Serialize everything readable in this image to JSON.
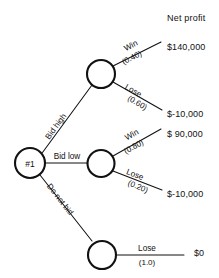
{
  "diagram": {
    "column_header": "Net profit",
    "colors": {
      "ink": "#111111",
      "background": "#ffffff"
    },
    "decision_node": {
      "label": "#1",
      "kind": "decision-node"
    },
    "chance_nodes": [
      {
        "id": "bid-high-chance-node",
        "label": ""
      },
      {
        "id": "bid-low-chance-node",
        "label": ""
      },
      {
        "id": "do-not-bid-chance-node",
        "label": ""
      }
    ],
    "decision_branches": [
      {
        "label": "Bid high",
        "direction": "up"
      },
      {
        "label": "Bid low",
        "direction": "straight"
      },
      {
        "label": "Do not bid",
        "direction": "down"
      }
    ],
    "outcome_branches": [
      {
        "label": "Win",
        "probability": "(0.40)",
        "payoff": "$140,000",
        "parent": "Bid high"
      },
      {
        "label": "Lose",
        "probability": "(0.60)",
        "payoff": "$-10,000",
        "parent": "Bid high"
      },
      {
        "label": "Win",
        "probability": "(0.80)",
        "payoff": "$ 90,000",
        "parent": "Bid low"
      },
      {
        "label": "Lose",
        "probability": "(0.20)",
        "payoff": "$-10,000",
        "parent": "Bid low"
      },
      {
        "label": "Lose",
        "probability": "(1.0)",
        "payoff": "$0",
        "parent": "Do not bid"
      }
    ],
    "payoffs": [
      "$140,000",
      "$-10,000",
      "$ 90,000",
      "$-10,000",
      "$0"
    ]
  }
}
